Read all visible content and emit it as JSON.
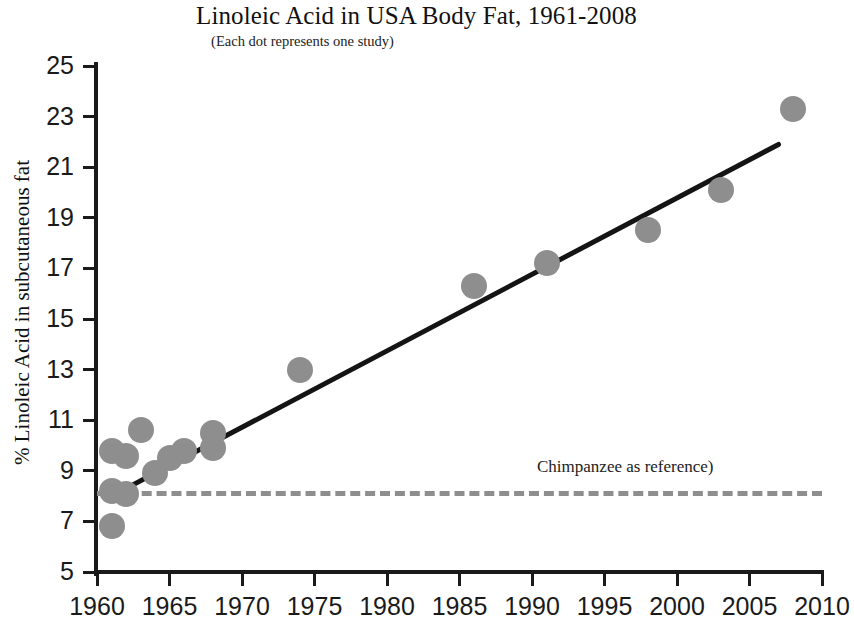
{
  "chart_data": {
    "type": "scatter",
    "title": "Linoleic Acid in USA Body Fat, 1961-2008",
    "subtitle": "(Each dot represents one study)",
    "xlabel": "",
    "ylabel": "% Linoleic Acid in subcutaneous fat",
    "xlim": [
      1960,
      2010
    ],
    "ylim": [
      5,
      25
    ],
    "xticks": [
      1960,
      1965,
      1970,
      1975,
      1980,
      1985,
      1990,
      1995,
      2000,
      2005,
      2010
    ],
    "yticks": [
      5,
      7,
      9,
      11,
      13,
      15,
      17,
      19,
      21,
      23,
      25
    ],
    "grid": false,
    "legend": "none",
    "series": [
      {
        "name": "Studies",
        "marker": "circle",
        "color": "#8e8e8e",
        "points": [
          {
            "x": 1961,
            "y": 9.8
          },
          {
            "x": 1961,
            "y": 8.2
          },
          {
            "x": 1961,
            "y": 6.8
          },
          {
            "x": 1962,
            "y": 9.6
          },
          {
            "x": 1962,
            "y": 8.1
          },
          {
            "x": 1963,
            "y": 10.6
          },
          {
            "x": 1964,
            "y": 8.9
          },
          {
            "x": 1965,
            "y": 9.5
          },
          {
            "x": 1966,
            "y": 9.8
          },
          {
            "x": 1968,
            "y": 10.5
          },
          {
            "x": 1968,
            "y": 9.9
          },
          {
            "x": 1974,
            "y": 13.0
          },
          {
            "x": 1986,
            "y": 16.3
          },
          {
            "x": 1991,
            "y": 17.2
          },
          {
            "x": 1998,
            "y": 18.5
          },
          {
            "x": 2003,
            "y": 20.1
          },
          {
            "x": 2008,
            "y": 23.3
          }
        ]
      }
    ],
    "trend_line": {
      "name": "Linear trend",
      "color": "#141414",
      "x_start": 1961,
      "y_start": 8.0,
      "x_end": 2007,
      "y_end": 21.9
    },
    "reference_line": {
      "label": "Chimpanzee as reference)",
      "value": 8.2,
      "x_start": 1960,
      "x_end": 2010,
      "style": "dashed",
      "color": "#8e8e8e"
    }
  }
}
